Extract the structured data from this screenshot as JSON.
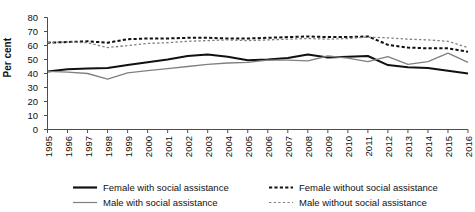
{
  "chart_data": {
    "type": "line",
    "title": "",
    "xlabel": "",
    "ylabel": "Per cent",
    "ylim": [
      0,
      80
    ],
    "ytick_values": [
      0,
      10,
      20,
      30,
      40,
      50,
      60,
      70,
      80
    ],
    "ytick_labels": [
      "0",
      "10",
      "20",
      "30",
      "40",
      "50",
      "60",
      "70",
      "80"
    ],
    "grid": false,
    "legend_position": "bottom",
    "x": [
      1995,
      1996,
      1997,
      1998,
      1999,
      2000,
      2001,
      2002,
      2003,
      2004,
      2005,
      2006,
      2007,
      2008,
      2009,
      2010,
      2011,
      2012,
      2013,
      2014,
      2015,
      2016
    ],
    "xtick_labels": [
      "1995",
      "1996",
      "1997",
      "1998",
      "1999",
      "2000",
      "2001",
      "2002",
      "2003",
      "2004",
      "2005",
      "2006",
      "2007",
      "2008",
      "2009",
      "2010",
      "2011",
      "2012",
      "2013",
      "2014",
      "2015",
      "2016"
    ],
    "series": [
      {
        "name": "Female with social assistance",
        "style": "solid",
        "color": "#111111",
        "width": 2.0,
        "values": [
          41.5,
          43.0,
          43.5,
          44.0,
          46.0,
          48.0,
          50.0,
          52.5,
          53.5,
          52.0,
          49.5,
          50.0,
          51.0,
          53.5,
          51.5,
          52.0,
          52.5,
          46.0,
          44.5,
          44.0,
          42.0,
          40.0
        ]
      },
      {
        "name": "Male with social assistance",
        "style": "solid",
        "color": "#808080",
        "width": 1.3,
        "values": [
          41.5,
          41.0,
          40.0,
          36.0,
          40.5,
          42.0,
          43.5,
          45.0,
          46.5,
          47.5,
          48.0,
          49.5,
          49.5,
          49.0,
          52.5,
          51.0,
          48.5,
          52.0,
          46.5,
          48.5,
          54.5,
          48.0
        ]
      },
      {
        "name": "Female without social assistance",
        "style": "dashed",
        "color": "#111111",
        "width": 2.0,
        "values": [
          62.0,
          62.5,
          63.0,
          62.0,
          64.5,
          65.0,
          65.0,
          65.5,
          65.5,
          65.0,
          65.0,
          65.5,
          66.0,
          66.5,
          66.0,
          66.0,
          66.5,
          60.5,
          58.5,
          58.0,
          58.0,
          55.5
        ]
      },
      {
        "name": "Male without social assistance",
        "style": "dotted",
        "color": "#808080",
        "width": 1.3,
        "values": [
          62.0,
          62.5,
          62.0,
          58.5,
          60.0,
          61.5,
          62.0,
          63.0,
          63.5,
          64.0,
          63.5,
          64.0,
          64.5,
          65.0,
          64.5,
          65.0,
          66.0,
          65.5,
          64.5,
          64.0,
          63.0,
          58.5
        ]
      }
    ]
  },
  "legend": {
    "items": [
      {
        "label": "Female with social assistance",
        "style": "solid",
        "color": "#111111",
        "width": 2.2
      },
      {
        "label": "Male with social assistance",
        "style": "solid",
        "color": "#808080",
        "width": 1.2
      },
      {
        "label": "Female without social assistance",
        "style": "dashed",
        "color": "#111111",
        "width": 2.2
      },
      {
        "label": "Male without social assistance",
        "style": "dotted",
        "color": "#808080",
        "width": 1.2
      }
    ]
  }
}
